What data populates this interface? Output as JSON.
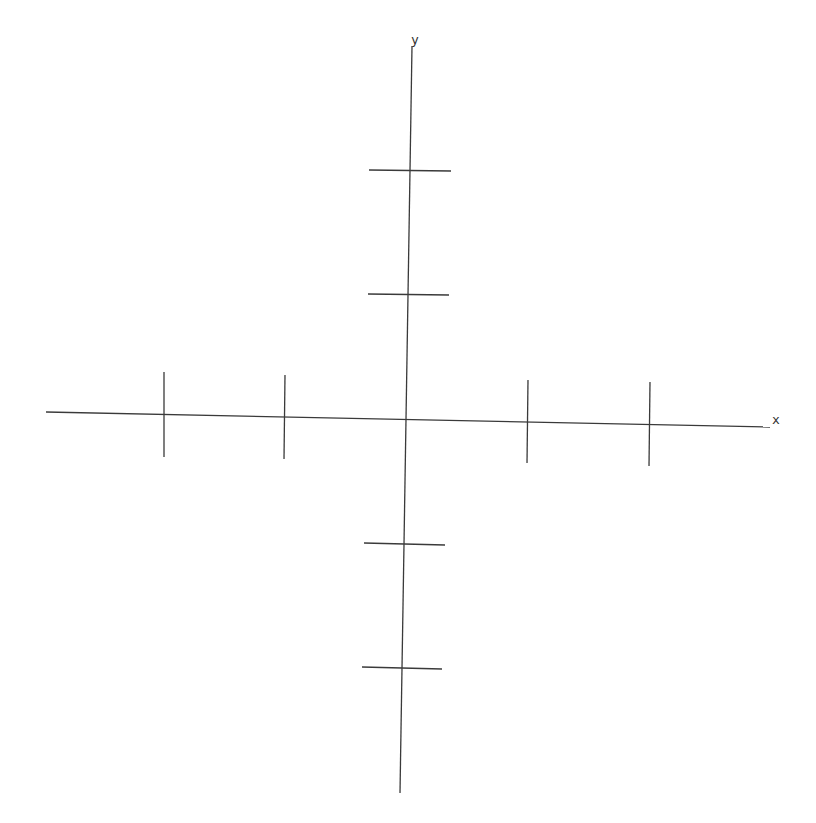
{
  "diagram": {
    "stroke_color": "#3a3a3a",
    "stroke_width": 1.3,
    "x_axis": {
      "label": "x",
      "label_pos": [
        772,
        413
      ],
      "line": [
        46,
        412,
        770,
        427
      ]
    },
    "y_axis": {
      "label": "y",
      "label_pos": [
        411,
        33
      ],
      "line": [
        412,
        46,
        400,
        793
      ]
    },
    "x_ticks": [
      {
        "line": [
          164,
          372,
          164,
          457
        ]
      },
      {
        "line": [
          285,
          375,
          284,
          459
        ]
      },
      {
        "line": [
          528,
          380,
          527,
          463
        ]
      },
      {
        "line": [
          650,
          382,
          649,
          466
        ]
      }
    ],
    "y_ticks": [
      {
        "line": [
          369,
          170,
          451,
          171
        ]
      },
      {
        "line": [
          368,
          294,
          449,
          295
        ]
      },
      {
        "line": [
          364,
          543,
          445,
          545
        ]
      },
      {
        "line": [
          362,
          667,
          442,
          669
        ]
      }
    ]
  }
}
